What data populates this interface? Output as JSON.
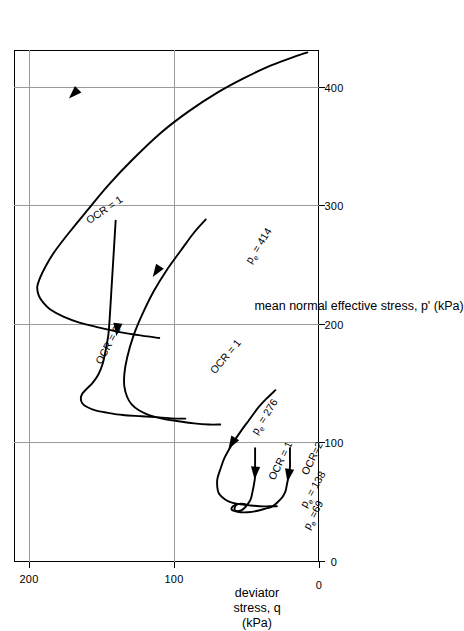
{
  "figure": {
    "background": "#ffffff",
    "line_color": "#000000",
    "grid_color": "#9a9a9a"
  },
  "axes": {
    "x_title": "mean normal effective stress, p' (kPa)",
    "y_title_line1": "deviator",
    "y_title_line2": "stress, q",
    "y_title_line3": "(kPa)",
    "x_ticks": [
      "0",
      "100",
      "200",
      "300",
      "400"
    ],
    "y_ticks": [
      "0",
      "100",
      "200"
    ]
  },
  "curve_labels": {
    "pe414": "p<sub>e</sub> = 414",
    "pe276": "p<sub>e</sub> = 276",
    "pe138": "p<sub>e</sub> = 138",
    "pe69": "p<sub>e</sub> =69",
    "ocr1_top": "OCR = 1",
    "ocr1_mid": "OCR = 1",
    "ocr2_mid": "OCR = 2",
    "ocr1_low": "OCR = 1",
    "ocr2_low": "OCR=2"
  },
  "chart_data": {
    "type": "line",
    "title": "",
    "xlabel": "mean normal effective stress, p' (kPa)",
    "ylabel": "deviator stress, q (kPa)",
    "xlim": [
      0,
      432
    ],
    "ylim": [
      0,
      210
    ],
    "xticks": [
      0,
      100,
      200,
      300,
      400
    ],
    "yticks": [
      0,
      100,
      200
    ],
    "grid": true,
    "legend": "inline-annotations",
    "arrow_meaning": "direction of effective stress path during undrained shearing (rightward start, moving left/up)",
    "series": [
      {
        "name": "pe = 414, OCR = 1",
        "label": "p_e = 414",
        "ocr": 1,
        "pe": 414,
        "annotation_ocr": "OCR = 1",
        "arrow_at": [
          395,
          169
        ],
        "points": [
          [
            430,
            8
          ],
          [
            425,
            20
          ],
          [
            418,
            35
          ],
          [
            408,
            52
          ],
          [
            396,
            70
          ],
          [
            380,
            90
          ],
          [
            362,
            109
          ],
          [
            340,
            128
          ],
          [
            318,
            145
          ],
          [
            296,
            160
          ],
          [
            278,
            172
          ],
          [
            262,
            182
          ],
          [
            250,
            188
          ],
          [
            240,
            192
          ],
          [
            232,
            194
          ],
          [
            225,
            193
          ],
          [
            219,
            190
          ],
          [
            213,
            185
          ],
          [
            207,
            176
          ],
          [
            202,
            165
          ],
          [
            198,
            152
          ],
          [
            194,
            137
          ],
          [
            191,
            122
          ],
          [
            189,
            110
          ]
        ]
      },
      {
        "name": "pe = 276, OCR = 1",
        "label": "p_e = 276",
        "ocr": 1,
        "pe": 276,
        "annotation_ocr": "OCR = 1",
        "arrow_at": [
          245,
          112
        ],
        "points": [
          [
            289,
            78
          ],
          [
            278,
            86
          ],
          [
            263,
            95
          ],
          [
            246,
            105
          ],
          [
            228,
            114
          ],
          [
            208,
            122
          ],
          [
            190,
            128
          ],
          [
            173,
            132
          ],
          [
            159,
            134
          ],
          [
            148,
            134
          ],
          [
            139,
            132
          ],
          [
            133,
            129
          ],
          [
            128,
            124
          ],
          [
            124,
            117
          ],
          [
            121,
            108
          ],
          [
            119,
            98
          ],
          [
            117,
            86
          ],
          [
            116,
            76
          ],
          [
            116,
            68
          ]
        ]
      },
      {
        "name": "pe = 276, OCR = 2",
        "label": "p_e = 276",
        "ocr": 2,
        "pe": 276,
        "annotation_ocr": "OCR = 2",
        "arrow_at": [
          196,
          139
        ],
        "points": [
          [
            288,
            140
          ],
          [
            268,
            141
          ],
          [
            248,
            142
          ],
          [
            228,
            143
          ],
          [
            208,
            144
          ],
          [
            192,
            145
          ],
          [
            178,
            147
          ],
          [
            167,
            149
          ],
          [
            158,
            152
          ],
          [
            151,
            156
          ],
          [
            146,
            160
          ],
          [
            142,
            163
          ],
          [
            138,
            164
          ],
          [
            134,
            163
          ],
          [
            131,
            160
          ],
          [
            128,
            154
          ],
          [
            126,
            146
          ],
          [
            124,
            135
          ],
          [
            123,
            122
          ],
          [
            122,
            110
          ],
          [
            121,
            99
          ],
          [
            121,
            92
          ]
        ]
      },
      {
        "name": "pe = 138, OCR = 1",
        "label": "p_e = 138",
        "ocr": 1,
        "pe": 138,
        "annotation_ocr": "OCR = 1",
        "arrow_at": [
          100,
          60
        ],
        "points": [
          [
            145,
            30
          ],
          [
            138,
            36
          ],
          [
            130,
            42
          ],
          [
            120,
            48
          ],
          [
            110,
            54
          ],
          [
            99,
            60
          ],
          [
            88,
            65
          ],
          [
            78,
            68
          ],
          [
            70,
            70
          ],
          [
            63,
            70
          ],
          [
            58,
            69
          ],
          [
            54,
            66
          ],
          [
            51,
            62
          ],
          [
            49,
            56
          ],
          [
            48,
            49
          ],
          [
            47,
            41
          ],
          [
            47,
            34
          ],
          [
            47,
            29
          ]
        ]
      },
      {
        "name": "pe = 69, OCR = 1",
        "label": "p_e = 69",
        "ocr": 1,
        "pe": 69,
        "annotation_ocr": "OCR = 1",
        "arrow_at": [
          75,
          44
        ],
        "points": [
          [
            96,
            44
          ],
          [
            88,
            44
          ],
          [
            80,
            44
          ],
          [
            72,
            44
          ],
          [
            64,
            45
          ],
          [
            58,
            46
          ],
          [
            53,
            47
          ],
          [
            49,
            49
          ],
          [
            46,
            51
          ],
          [
            44,
            53
          ],
          [
            43,
            55
          ],
          [
            43,
            57
          ],
          [
            44,
            58
          ],
          [
            46,
            58
          ],
          [
            48,
            57
          ],
          [
            49,
            55
          ],
          [
            49,
            52
          ]
        ]
      },
      {
        "name": "pe = 69, OCR = 2",
        "label": "p_e = 69",
        "ocr": 2,
        "pe": 69,
        "annotation_ocr": "OCR=2",
        "arrow_at": [
          73,
          21
        ],
        "points": [
          [
            96,
            20
          ],
          [
            88,
            20
          ],
          [
            80,
            20
          ],
          [
            72,
            21
          ],
          [
            66,
            22
          ],
          [
            60,
            23
          ],
          [
            55,
            25
          ],
          [
            51,
            28
          ],
          [
            47,
            32
          ],
          [
            45,
            37
          ],
          [
            43,
            43
          ],
          [
            42,
            49
          ],
          [
            42,
            54
          ],
          [
            43,
            58
          ],
          [
            44,
            60
          ],
          [
            46,
            60
          ],
          [
            48,
            58
          ],
          [
            49,
            55
          ],
          [
            49,
            52
          ],
          [
            48,
            49
          ]
        ]
      }
    ]
  }
}
